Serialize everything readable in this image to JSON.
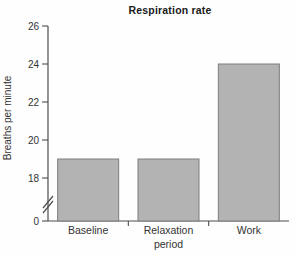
{
  "figure": {
    "background": "#fefefe"
  },
  "chart_data": {
    "type": "bar",
    "title": "Respiration rate",
    "xlabel": "",
    "ylabel": "Breaths per minute",
    "categories": [
      "Baseline",
      "Relaxation period",
      "Work"
    ],
    "category_lines": [
      [
        "Baseline"
      ],
      [
        "Relaxation",
        "period"
      ],
      [
        "Work"
      ]
    ],
    "values": [
      19,
      19,
      24
    ],
    "yticks": [
      0,
      18,
      20,
      22,
      24,
      26
    ],
    "ylim": [
      0,
      26
    ],
    "ylim_display": [
      18,
      26
    ],
    "axis_break": true,
    "grid": false,
    "legend": "none",
    "bar_color": "#b3b3b3",
    "bar_border_color": "#7d7d7d",
    "axis_color": "#4d4d4d",
    "text_color": "#333333",
    "title_color": "#1a1a1a"
  }
}
